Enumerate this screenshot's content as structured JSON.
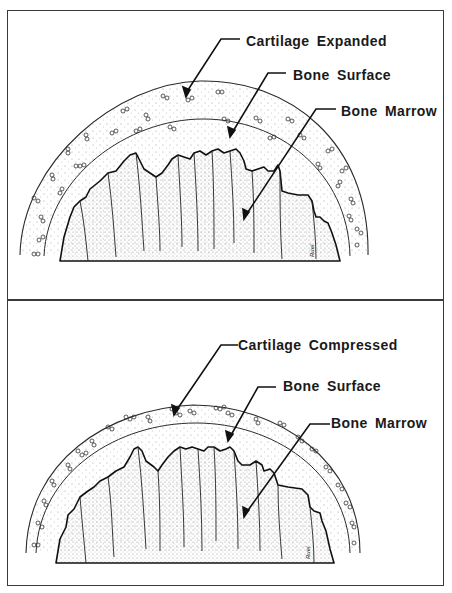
{
  "figure": {
    "panels": [
      {
        "id": "top",
        "state": "expanded",
        "labels": {
          "cartilage": "Cartilage Expanded",
          "bone_surface": "Bone Surface",
          "bone_marrow": "Bone Marrow"
        },
        "signature": "Ruel"
      },
      {
        "id": "bottom",
        "state": "compressed",
        "labels": {
          "cartilage": "Cartilage Compressed",
          "bone_surface": "Bone Surface",
          "bone_marrow": "Bone Marrow"
        },
        "signature": "Ruel"
      }
    ],
    "colors": {
      "ink": "#1a1a1a",
      "frame": "#3a3a3a",
      "background": "#ffffff",
      "stipple": "#8a8a8a"
    }
  }
}
